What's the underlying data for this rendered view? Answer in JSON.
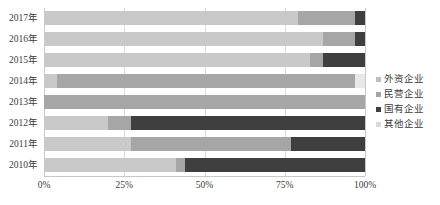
{
  "chart_data": {
    "type": "bar",
    "orientation": "horizontal",
    "stacked": true,
    "stack_mode": "percent",
    "title": "",
    "subtitle": "",
    "xlabel": "",
    "ylabel": "",
    "xlim": [
      0,
      100
    ],
    "xtick_labels": [
      "0%",
      "25%",
      "50%",
      "75%",
      "100%"
    ],
    "xtick_values": [
      0,
      25,
      50,
      75,
      100
    ],
    "grid": true,
    "grid_axis": "x",
    "legend_position": "right",
    "categories": [
      "2017年",
      "2016年",
      "2015年",
      "2014年",
      "2013年",
      "2012年",
      "2011年",
      "2010年"
    ],
    "series": [
      {
        "name": "外资企业",
        "color": "#c9c9c9",
        "values": [
          79,
          87,
          83,
          4,
          0,
          20,
          27,
          41
        ]
      },
      {
        "name": "民营企业",
        "color": "#a6a6a6",
        "values": [
          18,
          10,
          4,
          93,
          100,
          7,
          50,
          3
        ]
      },
      {
        "name": "国有企业",
        "color": "#3f3f3f",
        "values": [
          3,
          3,
          13,
          0,
          0,
          73,
          23,
          56
        ]
      },
      {
        "name": "其他企业",
        "color": "#e8e8e8",
        "values": [
          0,
          0,
          0,
          3,
          0,
          0,
          0,
          0
        ]
      }
    ],
    "annotations": []
  },
  "legend": {
    "items": [
      {
        "label": "外资企业",
        "color": "#bfbfbf"
      },
      {
        "label": "民营企业",
        "color": "#a6a6a6"
      },
      {
        "label": "国有企业",
        "color": "#3f3f3f"
      },
      {
        "label": "其他企业",
        "color": "#d9d9d9"
      }
    ]
  },
  "colors": {
    "grid": "#dcdcdc",
    "axis": "#c9c9c9",
    "text": "#3b3b3b",
    "background": "#ffffff"
  }
}
